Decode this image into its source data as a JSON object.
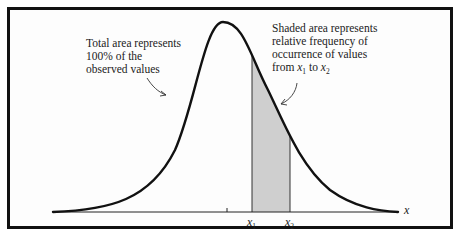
{
  "figure": {
    "type": "normal-distribution-diagram",
    "border_color": "#111111",
    "curve_color": "#111111",
    "shade_color": "#c8c8c8"
  },
  "annotations": {
    "total_area": {
      "lines": [
        "Total area represents",
        "100% of the",
        "observed values"
      ]
    },
    "shaded_area": {
      "lines": [
        "Shaded area represents",
        "relative frequency of",
        "occurrence of values"
      ],
      "last_line_prefix": "from ",
      "last_line_var1": "x",
      "last_line_sub1": "1",
      "last_line_mid": " to ",
      "last_line_var2": "x",
      "last_line_sub2": "2"
    }
  },
  "axis": {
    "label": "x",
    "ticks": [
      {
        "var": "x",
        "sub": "1"
      },
      {
        "var": "x",
        "sub": "2"
      }
    ]
  }
}
